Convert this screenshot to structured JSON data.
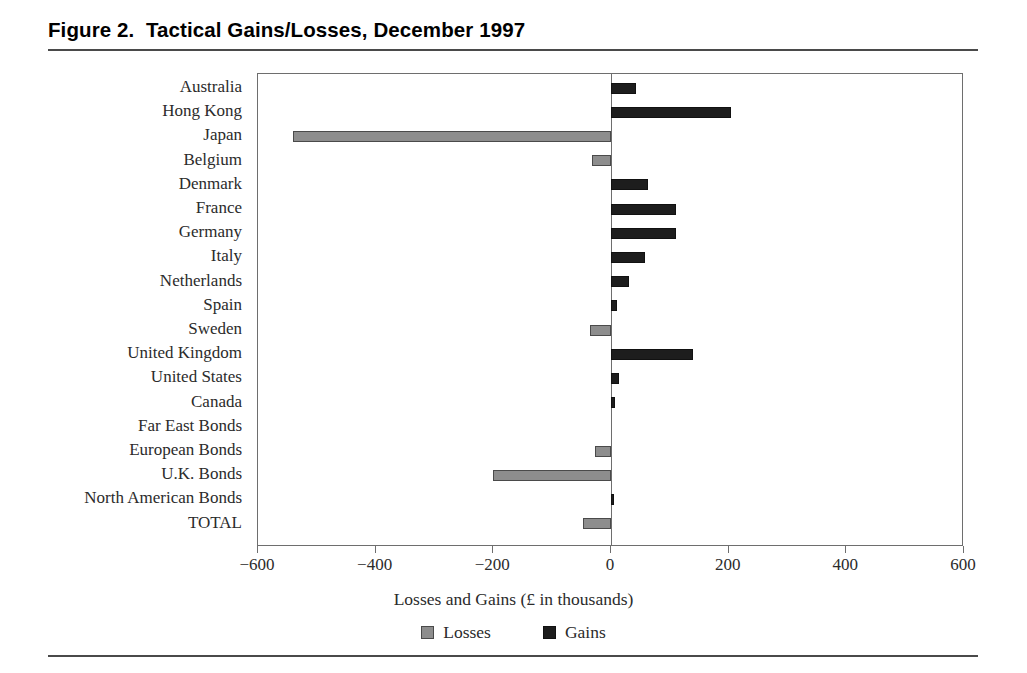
{
  "figure": {
    "title": "Figure 2.  Tactical Gains/Losses, December 1997"
  },
  "axis": {
    "x_title": "Losses and Gains (£ in thousands)",
    "ticks": [
      "−600",
      "−400",
      "−200",
      "0",
      "200",
      "400",
      "600"
    ]
  },
  "legend": {
    "losses_label": "Losses",
    "gains_label": "Gains",
    "losses_color": "#8d8d8d",
    "gains_color": "#1d1d1d"
  },
  "chart_data": {
    "type": "bar",
    "orientation": "horizontal",
    "title": "Figure 2.  Tactical Gains/Losses, December 1997",
    "xlabel": "Losses and Gains (£ in thousands)",
    "ylabel": "",
    "xlim": [
      -600,
      600
    ],
    "xticks": [
      -600,
      -400,
      -200,
      0,
      200,
      400,
      600
    ],
    "grid": false,
    "legend_position": "bottom",
    "categories": [
      "Australia",
      "Hong Kong",
      "Japan",
      "Belgium",
      "Denmark",
      "France",
      "Germany",
      "Italy",
      "Netherlands",
      "Spain",
      "Sweden",
      "United Kingdom",
      "United States",
      "Canada",
      "Far East Bonds",
      "European Bonds",
      "U.K. Bonds",
      "North American Bonds",
      "TOTAL"
    ],
    "values": [
      43,
      204,
      -540,
      -32,
      63,
      110,
      110,
      58,
      30,
      11,
      -36,
      140,
      14,
      6,
      0,
      -27,
      -201,
      5,
      -47
    ],
    "series": [
      {
        "name": "Losses",
        "color": "#8d8d8d",
        "values": [
          0,
          0,
          -540,
          -32,
          0,
          0,
          0,
          0,
          0,
          0,
          -36,
          0,
          0,
          0,
          0,
          -27,
          -201,
          0,
          -47
        ]
      },
      {
        "name": "Gains",
        "color": "#1d1d1d",
        "values": [
          43,
          204,
          0,
          0,
          63,
          110,
          110,
          58,
          30,
          11,
          0,
          140,
          14,
          6,
          0,
          0,
          0,
          5,
          0
        ]
      }
    ]
  }
}
